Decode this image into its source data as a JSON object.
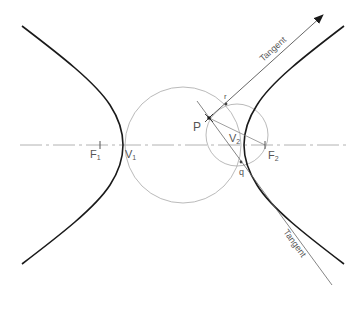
{
  "diagram": {
    "colors": {
      "curve": "#1a1a1a",
      "construction": "#999999",
      "axis": "#a0a0a0",
      "label": "#555555",
      "arrow": "#1a1a1a"
    },
    "labels": {
      "f1": {
        "main": "F",
        "sub": "1"
      },
      "v1": {
        "main": "V",
        "sub": "1"
      },
      "f2": {
        "main": "F",
        "sub": "2"
      },
      "v2": {
        "main": "V",
        "sub": "2"
      },
      "p": "P",
      "r": "r",
      "q": "q",
      "tangent_upper": "Tangent",
      "tangent_lower": "Tangent"
    },
    "points": {
      "F1": [
        100,
        145
      ],
      "V1": [
        123,
        145
      ],
      "F2": [
        265,
        145
      ],
      "V2": [
        244,
        145
      ],
      "P": [
        209,
        118
      ],
      "r": [
        226,
        104
      ],
      "q": [
        241,
        162
      ]
    },
    "circles": [
      {
        "name": "large-circle",
        "cx": 183,
        "cy": 145,
        "r": 58
      },
      {
        "name": "small-circle",
        "cx": 237,
        "cy": 135,
        "r": 31
      }
    ]
  }
}
